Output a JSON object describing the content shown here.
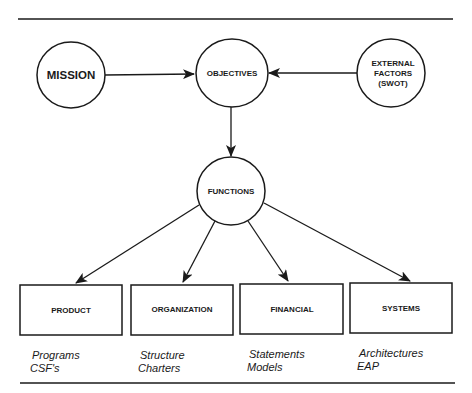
{
  "diagram": {
    "nodes": {
      "mission": {
        "label": "MISSION"
      },
      "objectives": {
        "label": "OBJECTIVES"
      },
      "external": {
        "lines": [
          "EXTERNAL",
          "FACTORS",
          "(SWOT)"
        ]
      },
      "functions": {
        "label": "FUNCTIONS"
      }
    },
    "boxes": [
      {
        "label": "PRODUCT",
        "details": [
          "Programs",
          "CSF's"
        ]
      },
      {
        "label": "ORGANIZATION",
        "details": [
          "Structure",
          "Charters"
        ]
      },
      {
        "label": "FINANCIAL",
        "details": [
          "Statements",
          "Models"
        ]
      },
      {
        "label": "SYSTEMS",
        "details": [
          "Architectures",
          "EAP"
        ]
      }
    ],
    "edges": [
      {
        "from": "MISSION",
        "to": "OBJECTIVES"
      },
      {
        "from": "EXTERNAL FACTORS (SWOT)",
        "to": "OBJECTIVES"
      },
      {
        "from": "OBJECTIVES",
        "to": "FUNCTIONS"
      },
      {
        "from": "FUNCTIONS",
        "to": "PRODUCT"
      },
      {
        "from": "FUNCTIONS",
        "to": "ORGANIZATION"
      },
      {
        "from": "FUNCTIONS",
        "to": "FINANCIAL"
      },
      {
        "from": "FUNCTIONS",
        "to": "SYSTEMS"
      }
    ],
    "colors": {
      "ink": "#1a1a1a",
      "background": "#ffffff"
    }
  }
}
